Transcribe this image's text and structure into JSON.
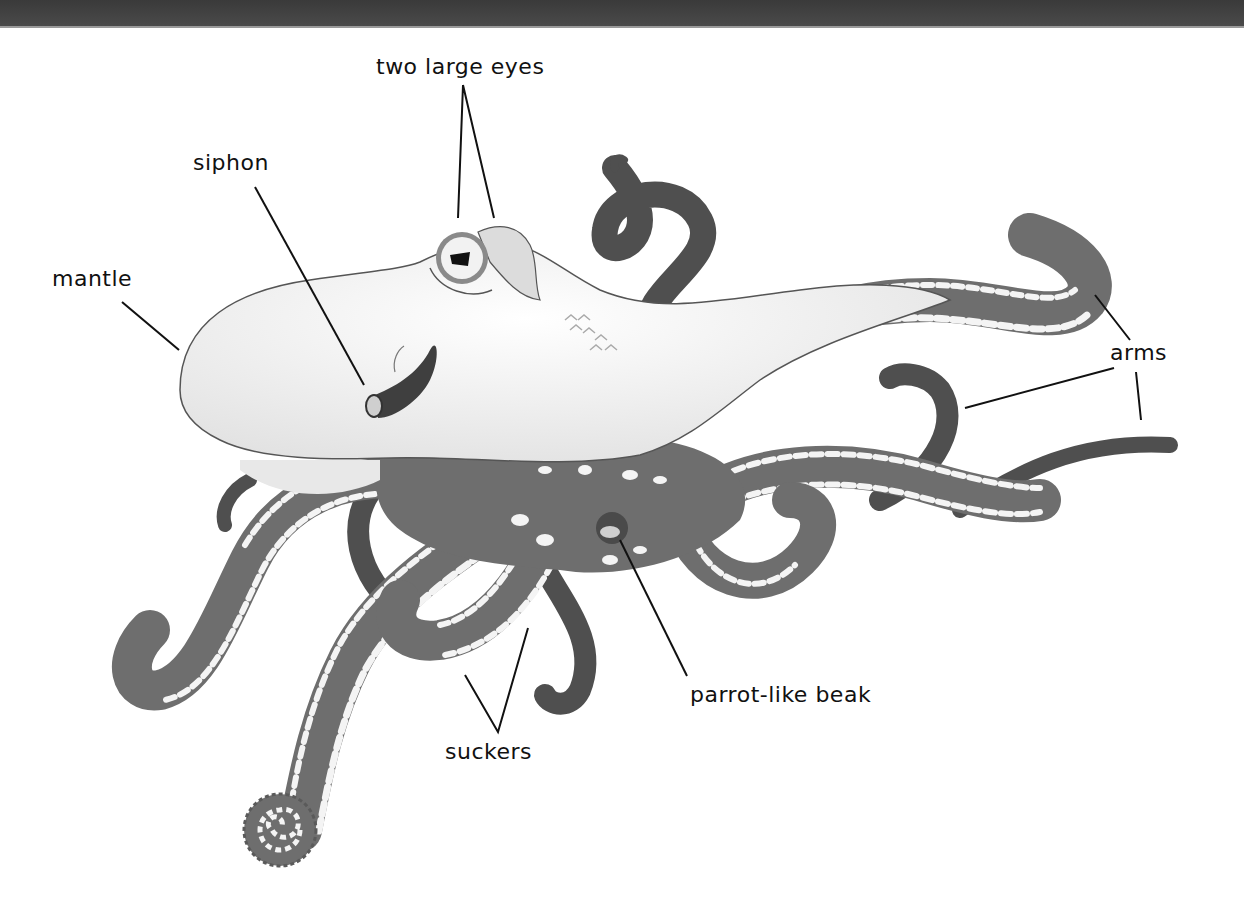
{
  "diagram": {
    "colors": {
      "background": "#ffffff",
      "top_bar": "#444444",
      "body_fill": "#f2f2f2",
      "body_outline": "#555555",
      "arm_fill": "#6e6e6e",
      "arm_dark": "#4f4f4f",
      "sucker_fill": "#f4f4f4",
      "leader_line": "#111111",
      "label_text": "#111111"
    },
    "labels": {
      "eyes": "two large eyes",
      "siphon": "siphon",
      "mantle": "mantle",
      "arms": "arms",
      "beak": "parrot-like beak",
      "suckers": "suckers"
    }
  }
}
